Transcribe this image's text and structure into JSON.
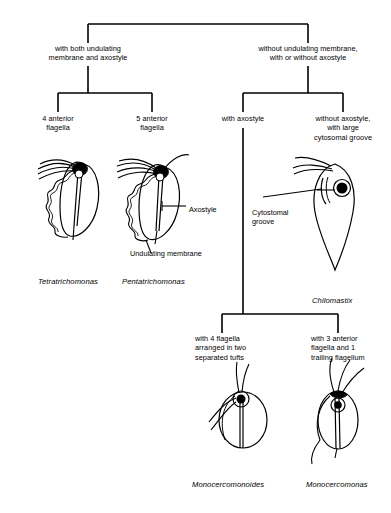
{
  "diagram": {
    "type": "dichotomous-identification-key"
  },
  "branch_labels": {
    "level1_left": "with both undulating\nmembrane and axostyle",
    "level1_right": "without undulating membrane,\nwith or without axostyle",
    "level2_a": "4 anterior\nflagella",
    "level2_b": "5 anterior\nflagella",
    "level2_c": "with axostyle",
    "level2_d": "without axostyle,\nwith large\ncytosomal groove",
    "level3_a": "with 4 flagella\narranged in two\nseparated tufts",
    "level3_b": "with 3 anterior\nflagella and 1\ntrailing flagellum"
  },
  "organisms": [
    {
      "name": "Tetratrichomonas"
    },
    {
      "name": "Pentatrichomonas"
    },
    {
      "name": "Chilomastix"
    },
    {
      "name": "Monocercomonoides"
    },
    {
      "name": "Monocercomonas"
    }
  ],
  "annotations": {
    "axostyle": "Axostyle",
    "undulating_membrane": "Undulating membrane",
    "cytostomal_groove": "Cytostomal\ngroove"
  },
  "colors": {
    "line": "#000000",
    "background": "#ffffff",
    "text": "#000000"
  }
}
